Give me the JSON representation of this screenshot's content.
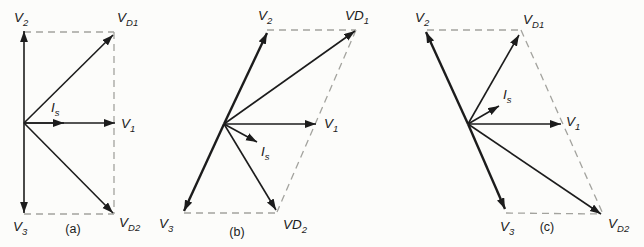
{
  "figure": {
    "colors": {
      "background": "#fcfcfa",
      "vector_stroke": "#1c1c1c",
      "dashed_stroke": "#a3a39e",
      "text": "#1b1b1b"
    },
    "panels": [
      {
        "caption": "(a)",
        "labels": {
          "v2": {
            "main": "V",
            "sub": "2"
          },
          "vd1": {
            "main": "V",
            "sub": "D1"
          },
          "is": {
            "main": "I",
            "sub": "s"
          },
          "v1": {
            "main": "V",
            "sub": "1"
          },
          "v3": {
            "main": "V",
            "sub": "3"
          },
          "vd2": {
            "main": "V",
            "sub": "D2"
          }
        }
      },
      {
        "caption": "(b)",
        "labels": {
          "v2": {
            "main": "V",
            "sub": "2"
          },
          "vd1": {
            "main": "VD",
            "sub": "1"
          },
          "is": {
            "main": "I",
            "sub": "s"
          },
          "v1": {
            "main": "V",
            "sub": "1"
          },
          "v3": {
            "main": "V",
            "sub": "3"
          },
          "vd2": {
            "main": "VD",
            "sub": "2"
          }
        }
      },
      {
        "caption": "(c)",
        "labels": {
          "v2": {
            "main": "V",
            "sub": "2"
          },
          "vd1": {
            "main": "V",
            "sub": "D1"
          },
          "is": {
            "main": "I",
            "sub": "s"
          },
          "v1": {
            "main": "V",
            "sub": "1"
          },
          "v3": {
            "main": "V",
            "sub": "3"
          },
          "vd2": {
            "main": "V",
            "sub": "D2"
          }
        }
      }
    ]
  }
}
